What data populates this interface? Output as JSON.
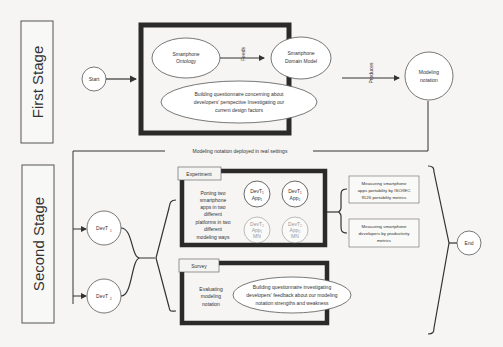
{
  "stages": {
    "first": "First Stage",
    "second": "Second Stage"
  },
  "nodes": {
    "start": "Start",
    "ontology": [
      "Smartphone",
      "Ontology"
    ],
    "domain_model": [
      "Smartphone",
      "Domain Model"
    ],
    "questionnaire1": [
      "Building questionnaire concerning about",
      "developers' perspective Investigating our",
      "current design factors"
    ],
    "modeling_notation": [
      "Modeling",
      "notation"
    ],
    "devt1": "DevT",
    "devt1_sub": "1",
    "devt2": "DevT",
    "devt2_sub": "2",
    "end": "End"
  },
  "edges": {
    "feeds": "Feeds",
    "produces": "Produces",
    "deployed": "Modeling notation deployed in real settings"
  },
  "experiment": {
    "label": "Experiment",
    "description": [
      "Porting two",
      "smartphone",
      "apps in two",
      "different",
      "platforms in two",
      "different",
      "modeling ways"
    ],
    "apps": [
      {
        "line1": "DevT₁",
        "line2": "App₁",
        "faded": false
      },
      {
        "line1": "DevT₁",
        "line2": "App₂",
        "faded": false
      },
      {
        "line1": "DevT₂",
        "line2": "App₁",
        "line3": "MN",
        "faded": true
      },
      {
        "line1": "DevT₂",
        "line2": "App₂",
        "line3": "MN",
        "faded": true
      }
    ]
  },
  "survey": {
    "label": "Survey",
    "description": [
      "Evaluating",
      "modeling",
      "notation"
    ],
    "questionnaire": [
      "Building questionnaire investigating",
      "developers' feedback about our modeling",
      "notation strengths and weakness"
    ]
  },
  "metrics": [
    [
      "Measuring smartphone",
      "apps portability by ISO/IEC",
      "9126 portability metrics"
    ],
    [
      "Measuring smartphone",
      "developers by productivity",
      "metrics"
    ]
  ]
}
